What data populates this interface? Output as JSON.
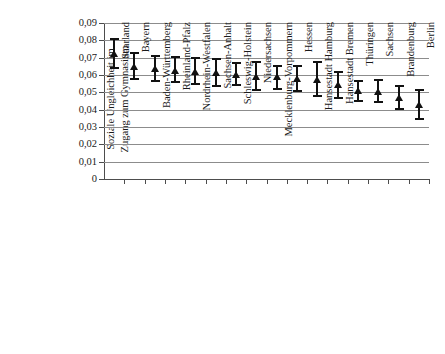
{
  "chart_data": {
    "type": "scatter",
    "title": "",
    "subtitle": "",
    "xlabel": "",
    "ylabel": "Soziale Ungleichheit im Zugang zum Gymnasium",
    "ylabel_lines": [
      "Soziale Ungleichheit im",
      "Zugang zum Gymnasium"
    ],
    "ylim": [
      0,
      0.09
    ],
    "ytick_values": [
      0.09,
      0.08,
      0.07,
      0.06,
      0.05,
      0.04,
      0.03,
      0.02,
      0.01,
      0
    ],
    "ytick_labels": [
      "0,09",
      "0,08",
      "0,07",
      "0,06",
      "0,05",
      "0,04",
      "0,03",
      "0,02",
      "0,01",
      "0"
    ],
    "grid": true,
    "grid_axis": "y",
    "legend": false,
    "error_bars": true,
    "marker": "triangle",
    "marker_color": "#111111",
    "grid_color": "#8c8c8c",
    "axis_color": "#4d4d4d",
    "categories": [
      "Saarland",
      "Bayern",
      "Baden-Württemberg",
      "Rheinland-Pfalz",
      "Nordrhein-Westfalen",
      "Sachsen-Anhalt",
      "Schleswig-Holstein",
      "Niedersachsen",
      "Mecklenburg-Vorpommern",
      "Hessen",
      "Hansestadt Hamburg",
      "Hansestadt Bremen",
      "Thüringen",
      "Sachsen",
      "Brandenburg",
      "Berlin"
    ],
    "values": [
      0.0723,
      0.065,
      0.0636,
      0.0628,
      0.0619,
      0.0612,
      0.0603,
      0.0591,
      0.0589,
      0.0578,
      0.0572,
      0.0543,
      0.0508,
      0.0507,
      0.0473,
      0.043
    ],
    "ci_lower": [
      0.0642,
      0.0577,
      0.0564,
      0.0562,
      0.0547,
      0.0534,
      0.054,
      0.0513,
      0.0521,
      0.0507,
      0.048,
      0.0468,
      0.045,
      0.0445,
      0.0405,
      0.0348
    ],
    "ci_upper": [
      0.0808,
      0.0725,
      0.071,
      0.0703,
      0.0697,
      0.0695,
      0.0668,
      0.0673,
      0.065,
      0.0652,
      0.0677,
      0.0619,
      0.0566,
      0.0573,
      0.0536,
      0.0515
    ]
  }
}
